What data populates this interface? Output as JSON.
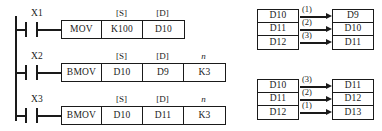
{
  "ladder": {
    "rungs": [
      {
        "contact": "X1",
        "contact_type": "normally-open",
        "headers": {
          "s": "[S]",
          "d": "[D]",
          "n": ""
        },
        "cells": [
          {
            "name": "instruction",
            "text": "MOV"
          },
          {
            "name": "source",
            "text": "K100"
          },
          {
            "name": "destination",
            "text": "D10"
          }
        ]
      },
      {
        "contact": "X2",
        "contact_type": "normally-open",
        "headers": {
          "s": "[S]",
          "d": "[D]",
          "n": "n"
        },
        "cells": [
          {
            "name": "instruction",
            "text": "BMOV"
          },
          {
            "name": "source",
            "text": "D10"
          },
          {
            "name": "destination",
            "text": "D9"
          },
          {
            "name": "count",
            "text": "K3"
          }
        ]
      },
      {
        "contact": "X3",
        "contact_type": "normally-open",
        "headers": {
          "s": "[S]",
          "d": "[D]",
          "n": "n"
        },
        "cells": [
          {
            "name": "instruction",
            "text": "BMOV"
          },
          {
            "name": "source",
            "text": "D10"
          },
          {
            "name": "destination",
            "text": "D11"
          },
          {
            "name": "count",
            "text": "K3"
          }
        ]
      }
    ]
  },
  "diagrams": [
    {
      "name": "bmov-forward-transfer",
      "source": [
        "D10",
        "D11",
        "D12"
      ],
      "destination": [
        "D9",
        "D10",
        "D11"
      ],
      "order": [
        "(1)",
        "(2)",
        "(3)"
      ]
    },
    {
      "name": "bmov-reverse-transfer",
      "source": [
        "D10",
        "D11",
        "D12"
      ],
      "destination": [
        "D11",
        "D12",
        "D13"
      ],
      "order": [
        "(3)",
        "(2)",
        "(1)"
      ]
    }
  ],
  "colors": {
    "ink": "#1a1a1a",
    "background": "#ffffff"
  }
}
